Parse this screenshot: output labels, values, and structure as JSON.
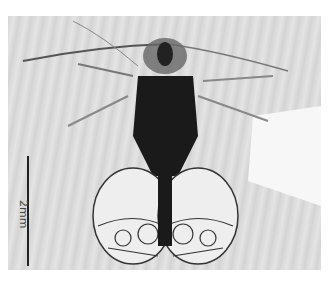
{
  "figure": {
    "scale_bar": {
      "label": "2mm"
    },
    "colors": {
      "background": "#dcdcdc",
      "specimen_dark": "#1a1a1a",
      "scale_bar": "#222222"
    }
  }
}
